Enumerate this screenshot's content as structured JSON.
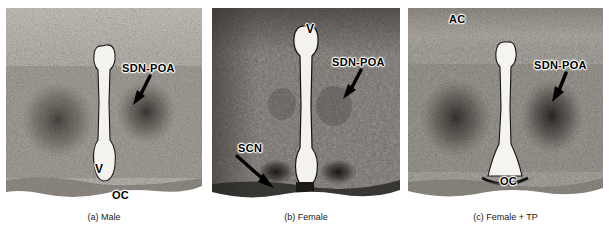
{
  "figure": {
    "background_color": "#ffffff",
    "panel_count": 3
  },
  "panels": [
    {
      "id": "panel-a",
      "caption": "(a) Male",
      "tone": "light",
      "base_color": "#b9b4ac",
      "annotations": [
        {
          "name": "sdn-poa-label",
          "text": "SDN-POA",
          "x": 122,
          "y": 62,
          "size": "med"
        },
        {
          "name": "ventricle-label",
          "text": "V",
          "x": 95,
          "y": 162,
          "size": "big"
        },
        {
          "name": "optic-chiasm-label",
          "text": "OC",
          "x": 112,
          "y": 188,
          "size": "med"
        }
      ],
      "arrows": [
        {
          "name": "sdn-poa-arrow",
          "x1": 142,
          "y1": 76,
          "x2": 133,
          "y2": 93
        }
      ]
    },
    {
      "id": "panel-b",
      "caption": "(b) Female",
      "tone": "dark",
      "base_color": "#8a857e",
      "annotations": [
        {
          "name": "ventricle-label",
          "text": "V",
          "x": 308,
          "y": 24,
          "size": "big"
        },
        {
          "name": "sdn-poa-label",
          "text": "SDN-POA",
          "x": 334,
          "y": 56,
          "size": "med"
        },
        {
          "name": "scn-label",
          "text": "SCN",
          "x": 238,
          "y": 142,
          "size": "med"
        }
      ],
      "arrows": [
        {
          "name": "sdn-poa-arrow",
          "x1": 356,
          "y1": 72,
          "x2": 346,
          "y2": 90
        },
        {
          "name": "scn-arrow",
          "x1": 237,
          "y1": 155,
          "x2": 266,
          "y2": 177
        }
      ]
    },
    {
      "id": "panel-c",
      "caption": "(c) Female + TP",
      "tone": "mid",
      "base_color": "#a8a49c",
      "annotations": [
        {
          "name": "anterior-commissure-label",
          "text": "AC",
          "x": 449,
          "y": 12,
          "size": "med"
        },
        {
          "name": "sdn-poa-label",
          "text": "SDN-POA",
          "x": 534,
          "y": 59,
          "size": "med"
        },
        {
          "name": "optic-chiasm-label",
          "text": "OC",
          "x": 500,
          "y": 174,
          "size": "med"
        }
      ],
      "arrows": [
        {
          "name": "sdn-poa-arrow",
          "x1": 557,
          "y1": 74,
          "x2": 549,
          "y2": 90
        }
      ]
    }
  ],
  "legend_terms": {
    "SDN-POA": "sexually dimorphic nucleus of the preoptic area",
    "V": "ventricle",
    "OC": "optic chiasm",
    "SCN": "suprachiasmatic nucleus",
    "AC": "anterior commissure",
    "TP": "testosterone propionate"
  }
}
